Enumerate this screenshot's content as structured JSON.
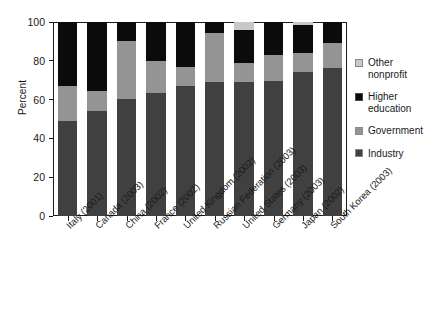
{
  "chart_data": {
    "type": "bar",
    "subtype": "stacked-bar-100-percent",
    "title": "",
    "xlabel": "",
    "ylabel": "Percent",
    "ylim": [
      0,
      100
    ],
    "yticks": [
      0,
      20,
      40,
      60,
      80,
      100
    ],
    "grid": false,
    "legend_position": "right",
    "categories": [
      "Italy (2001)",
      "Canada (2003)",
      "China (2002)",
      "France (2002)",
      "United Kingdom (2002)",
      "Russian Federation (2003)",
      "United States (2003)",
      "Germany (2003)",
      "Japan (2002)",
      "South Korea (2003)"
    ],
    "series": [
      {
        "name": "Industry",
        "color": "#404040",
        "values": [
          49.0,
          54.0,
          60.5,
          63.5,
          67.0,
          69.0,
          69.0,
          69.5,
          74.0,
          76.5
        ]
      },
      {
        "name": "Government",
        "color": "#949494",
        "values": [
          18.0,
          10.5,
          29.5,
          16.5,
          10.0,
          25.5,
          10.0,
          13.5,
          10.0,
          12.5
        ]
      },
      {
        "name": "Higher education",
        "color": "#0b0b0b",
        "values": [
          33.0,
          35.5,
          10.0,
          20.0,
          23.0,
          5.5,
          17.0,
          17.0,
          14.5,
          11.0
        ]
      },
      {
        "name": "Other nonprofit",
        "color": "#c8c8c8",
        "values": [
          0.0,
          0.0,
          0.0,
          0.0,
          0.0,
          0.0,
          4.0,
          0.0,
          1.5,
          0.0
        ]
      }
    ]
  },
  "legend": {
    "items": [
      {
        "label": "Other\nnonprofit",
        "swatch_class": "sw-other",
        "name": "other-nonprofit"
      },
      {
        "label": "Higher\neducation",
        "swatch_class": "sw-higher",
        "name": "higher-education"
      },
      {
        "label": "Government",
        "swatch_class": "sw-government",
        "name": "government"
      },
      {
        "label": "Industry",
        "swatch_class": "sw-industry",
        "name": "industry"
      }
    ]
  }
}
